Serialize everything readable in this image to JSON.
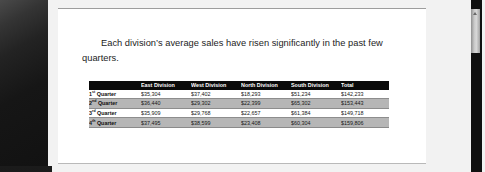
{
  "document": {
    "paragraph": "Each division’s average sales have risen significantly in the past few quarters."
  },
  "chart_data": {
    "type": "table",
    "title": "",
    "columns": [
      "",
      "East Division",
      "West Division",
      "North Division",
      "South Division",
      "Total"
    ],
    "categories": [
      "1st Quarter",
      "2nd Quarter",
      "3rd Quarter",
      "4th Quarter"
    ],
    "rows": [
      {
        "label_number": "1",
        "label_ordinal": "st",
        "label_rest": " Quarter",
        "east": "$35,304",
        "west": "$37,402",
        "north": "$18,293",
        "south": "$51,234",
        "total": "$142,233"
      },
      {
        "label_number": "2",
        "label_ordinal": "nd",
        "label_rest": " Quarter",
        "east": "$36,440",
        "west": "$29,302",
        "north": "$22,399",
        "south": "$65,302",
        "total": "$153,443"
      },
      {
        "label_number": "3",
        "label_ordinal": "rd",
        "label_rest": " Quarter",
        "east": "$35,909",
        "west": "$29,768",
        "north": "$22,657",
        "south": "$61,384",
        "total": "$149,718"
      },
      {
        "label_number": "4",
        "label_ordinal": "th",
        "label_rest": " Quarter",
        "east": "$37,495",
        "west": "$38,599",
        "north": "$23,408",
        "south": "$60,304",
        "total": "$159,806"
      }
    ],
    "series": [
      {
        "name": "East Division",
        "values": [
          35304,
          37402,
          18293,
          51234
        ]
      },
      {
        "name": "West Division",
        "values": [
          36440,
          29302,
          22399,
          65302
        ]
      },
      {
        "name": "North Division",
        "values": [
          35909,
          29768,
          22657,
          61384
        ]
      },
      {
        "name": "South Division",
        "values": [
          37495,
          38599,
          23408,
          60304
        ]
      }
    ],
    "header_background": "#0a0a0a",
    "header_text_color": "#ffffff",
    "band_color": "#b6b6b6"
  },
  "colors": {
    "page_background": "#ffffff",
    "panel_dark": "#1a1a1a",
    "scrollbar_thumb": "#c8c8c8"
  }
}
